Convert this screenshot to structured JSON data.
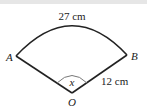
{
  "figure": {
    "type": "sector",
    "labels": {
      "arc_length": "27 cm",
      "radius": "12 cm",
      "angle": "x",
      "point_a": "A",
      "point_b": "B",
      "center": "O"
    },
    "colors": {
      "stroke": "#222222",
      "angle_arc": "#777777",
      "background": "#ffffff"
    }
  }
}
